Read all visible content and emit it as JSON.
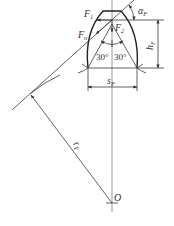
{
  "figure": {
    "labels": {
      "force_tangential": {
        "main": "F",
        "sub": "1"
      },
      "force_radial": {
        "main": "F",
        "sub": "2"
      },
      "force_normal": {
        "main": "F",
        "sub": "n"
      },
      "angle_load": {
        "main": "α",
        "sub": "F"
      },
      "height": {
        "main": "h",
        "sub": "F"
      },
      "thickness": {
        "main": "s",
        "sub": "F"
      },
      "radius": {
        "main": "r",
        "sub": "F"
      },
      "center": "O",
      "angle_left": "30°",
      "angle_right": "30°"
    },
    "colors": {
      "line": "#3a3a3a",
      "background": "#ffffff"
    }
  }
}
